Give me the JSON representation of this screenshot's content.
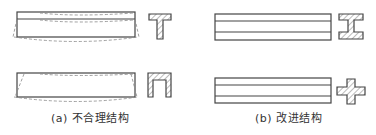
{
  "figure": {
    "panels": [
      {
        "id": "a",
        "caption": "(a) 不合理结构",
        "beams": [
          {
            "section": "T-section",
            "deformation": "dashed-bowed-outline"
          },
          {
            "section": "channel-section (inverted U)",
            "deformation": "dashed-bowed-outline"
          }
        ]
      },
      {
        "id": "b",
        "caption": "(b) 改进结构",
        "beams": [
          {
            "section": "I-section",
            "deformation": "none"
          },
          {
            "section": "cross-section",
            "deformation": "none"
          }
        ]
      }
    ],
    "colors": {
      "line": "#444444",
      "dashed": "#888888",
      "hatch": "#777777",
      "background": "#ffffff"
    }
  }
}
